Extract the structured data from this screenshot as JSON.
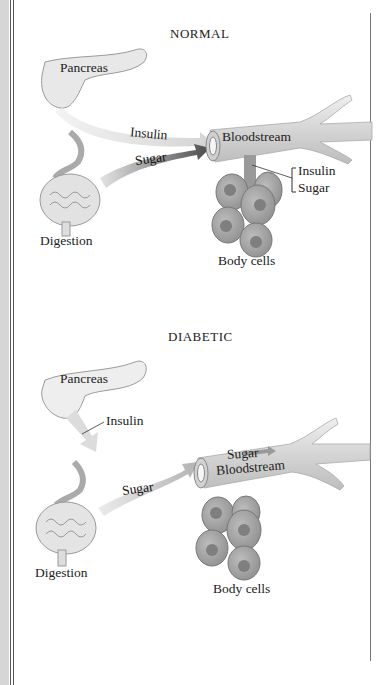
{
  "normal": {
    "title": "NORMAL",
    "pancreas": "Pancreas",
    "insulin_arrow": "Insulin",
    "sugar_arrow": "Sugar",
    "bloodstream": "Bloodstream",
    "bracket_insulin": "Insulin",
    "bracket_sugar": "Sugar",
    "digestion": "Digestion",
    "body_cells": "Body cells"
  },
  "diabetic": {
    "title": "DIABETIC",
    "pancreas": "Pancreas",
    "insulin_callout": "Insulin",
    "sugar_arrow": "Sugar",
    "blood_sugar": "Sugar",
    "bloodstream": "Bloodstream",
    "digestion": "Digestion",
    "body_cells": "Body cells"
  },
  "colors": {
    "organ_fill": "#e6e6e6",
    "vessel_fill": "#d9d9d9",
    "cell_fill": "#a8a8a8",
    "nucleus_fill": "#7f7f7f",
    "arrow_dark": "#555555",
    "arrow_light": "#cfcfcf"
  }
}
